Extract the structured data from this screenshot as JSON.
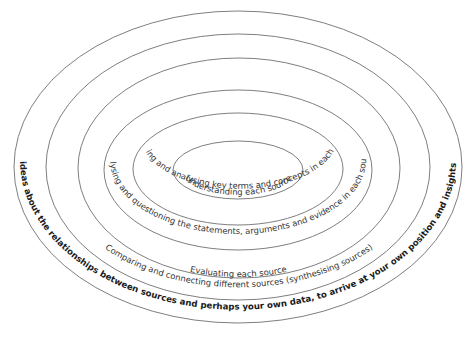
{
  "diagram": {
    "type": "concentric-ellipses",
    "rings": [
      {
        "id": "ring-1",
        "label": "Understanding each source",
        "bold": false
      },
      {
        "id": "ring-2",
        "label": "Identifying and analysing key terms and concepts in each source",
        "bold": false
      },
      {
        "id": "ring-3",
        "label": "Analysing and questioning the statements, arguments and evidence in each source",
        "bold": false
      },
      {
        "id": "ring-4",
        "label": "Evaluating each source",
        "bold": false
      },
      {
        "id": "ring-5",
        "label": "Comparing and connecting different sources (synthesising sources)",
        "bold": false
      },
      {
        "id": "ring-6",
        "label": "Using your ideas about the relationships between sources and perhaps your own data, to arrive at your own  position and insights (synthesis)",
        "bold": true
      }
    ],
    "colors": {
      "stroke": "#6f6f6f",
      "text": "#333333",
      "bold_text": "#1a1a1a",
      "background": "#ffffff"
    }
  }
}
